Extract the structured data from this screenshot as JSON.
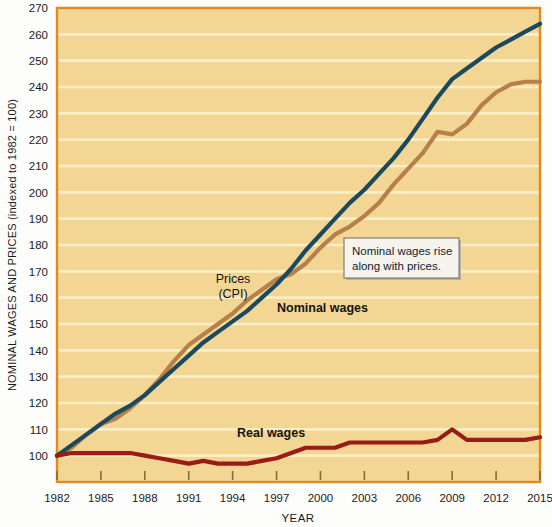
{
  "chart_data": {
    "type": "line",
    "title": "",
    "xlabel": "YEAR",
    "ylabel": "NOMINAL WAGES AND PRICES (indexed to 1982 = 100)",
    "xlim": [
      1982,
      2015
    ],
    "ylim": [
      90,
      270
    ],
    "yticks": [
      100,
      110,
      120,
      130,
      140,
      150,
      160,
      170,
      180,
      190,
      200,
      210,
      220,
      230,
      240,
      250,
      260,
      270
    ],
    "xticks": [
      1982,
      1985,
      1988,
      1991,
      1994,
      1997,
      2000,
      2003,
      2006,
      2009,
      2012,
      2015
    ],
    "grid": "horizontal",
    "legend": "inline-labels",
    "x": [
      1982,
      1983,
      1984,
      1985,
      1986,
      1987,
      1988,
      1989,
      1990,
      1991,
      1992,
      1993,
      1994,
      1995,
      1996,
      1997,
      1998,
      1999,
      2000,
      2001,
      2002,
      2003,
      2004,
      2005,
      2006,
      2007,
      2008,
      2009,
      2010,
      2011,
      2012,
      2013,
      2014,
      2015
    ],
    "series": [
      {
        "name": "Prices (CPI)",
        "color": "#b5804a",
        "values": [
          100,
          103,
          108,
          112,
          114,
          118,
          123,
          129,
          136,
          142,
          146,
          150,
          154,
          159,
          163,
          167,
          169,
          173,
          179,
          184,
          187,
          191,
          196,
          203,
          209,
          215,
          223,
          222,
          226,
          233,
          238,
          241,
          242,
          242
        ]
      },
      {
        "name": "Nominal wages",
        "color": "#1b4a60",
        "values": [
          100,
          104,
          108,
          112,
          116,
          119,
          123,
          128,
          133,
          138,
          143,
          147,
          151,
          155,
          160,
          165,
          171,
          178,
          184,
          190,
          196,
          201,
          207,
          213,
          220,
          228,
          236,
          243,
          247,
          251,
          255,
          258,
          261,
          264
        ]
      },
      {
        "name": "Real wages",
        "color": "#991c16",
        "values": [
          100,
          101,
          101,
          101,
          101,
          101,
          100,
          99,
          98,
          97,
          98,
          97,
          97,
          97,
          98,
          99,
          101,
          103,
          103,
          103,
          105,
          105,
          105,
          105,
          105,
          105,
          106,
          110,
          106,
          106,
          106,
          106,
          106,
          107
        ]
      }
    ],
    "annotations": [
      {
        "name": "nominal-wages-note",
        "text_line1": "Nominal wages rise",
        "text_line2": "along with prices."
      }
    ],
    "series_labels": {
      "prices_line1": "Prices",
      "prices_line2": "(CPI)",
      "nominal": "Nominal wages",
      "real": "Real wages"
    },
    "colors": {
      "plot_background": "#f3d694",
      "gridline": "#fbeec7",
      "frame": "#e2891f",
      "prices": "#b5804a",
      "nominal_wages": "#1b4a60",
      "real_wages": "#991c16"
    }
  }
}
